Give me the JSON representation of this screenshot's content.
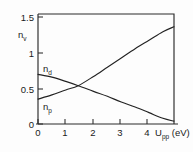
{
  "chart_data": {
    "type": "line",
    "title": "",
    "xlabel": "U_pp (eV)",
    "xlabel_main": "U",
    "xlabel_sub": "pp",
    "xlabel_unit": "(eV)",
    "ylabel": "n_v",
    "ylabel_main": "n",
    "ylabel_sub": "v",
    "xlim": [
      0,
      4.9
    ],
    "ylim": [
      0,
      1.55
    ],
    "grid": false,
    "legend": "inline-curve-labels",
    "xticks": [
      0,
      1,
      2,
      3,
      4
    ],
    "xtick_labels": [
      "0",
      "1",
      "2",
      "3",
      "4"
    ],
    "yticks": [
      0,
      0.5,
      1,
      1.5
    ],
    "ytick_labels": [
      "0",
      "0.5",
      "1",
      "1.5"
    ],
    "series": [
      {
        "name": "n_p",
        "label_main": "n",
        "label_sub": "p",
        "x": [
          0,
          0.5,
          1.0,
          1.45,
          2.0,
          2.5,
          3.0,
          3.5,
          4.0,
          4.5,
          4.9
        ],
        "values": [
          0.35,
          0.41,
          0.48,
          0.54,
          0.67,
          0.8,
          0.93,
          1.06,
          1.18,
          1.3,
          1.37
        ]
      },
      {
        "name": "n_d",
        "label_main": "n",
        "label_sub": "d",
        "x": [
          0,
          0.5,
          1.0,
          1.45,
          2.0,
          2.5,
          3.0,
          3.5,
          4.0,
          4.5,
          4.9
        ],
        "values": [
          0.7,
          0.66,
          0.6,
          0.54,
          0.46,
          0.39,
          0.31,
          0.24,
          0.16,
          0.08,
          0.04
        ]
      }
    ],
    "crossing_point": {
      "x": 1.45,
      "y": 0.54
    }
  },
  "colors": {
    "axis": "#2b2b2b",
    "curve": "#232323",
    "background": "#fdfdfd",
    "text": "#1a1a1a"
  }
}
